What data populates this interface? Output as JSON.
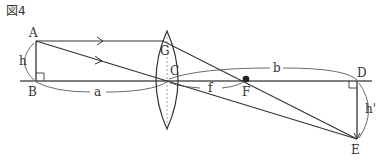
{
  "figure": {
    "title": "図4",
    "points": {
      "A": "A",
      "B": "B",
      "C": "C",
      "D": "D",
      "E": "E",
      "F": "F",
      "G": "G"
    },
    "lengths": {
      "h": "h",
      "h_prime": "h'",
      "a": "a",
      "b": "b",
      "f": "f"
    },
    "colors": {
      "line": "#333333",
      "axis": "#555555",
      "background": "#ffffff"
    }
  }
}
